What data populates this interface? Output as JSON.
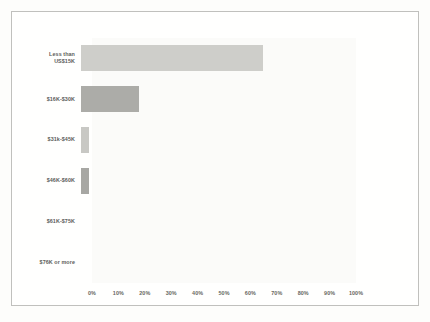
{
  "chart_data": {
    "type": "bar",
    "orientation": "horizontal",
    "title": "",
    "subtitle": "",
    "xlabel": "",
    "ylabel": "",
    "categories": [
      "Less than\nUS$15K",
      "$16K-$30K",
      "$31k-$45K",
      "$46K-$60K",
      "$61K-$75K",
      "$76K or more"
    ],
    "values": [
      69,
      22,
      3,
      3,
      0,
      0
    ],
    "value_suffix": "%",
    "xlim": [
      0,
      100
    ],
    "xticks": [
      0,
      10,
      20,
      30,
      40,
      50,
      60,
      70,
      80,
      90,
      100
    ],
    "xtick_labels": [
      "0%",
      "10%",
      "20%",
      "30%",
      "40%",
      "50%",
      "60%",
      "70%",
      "80%",
      "90%",
      "100%"
    ],
    "grid": false,
    "legend": null,
    "bar_colors": [
      "#c9c9c6",
      "#a3a3a0",
      "#c2c2bf",
      "#9d9d9a",
      "#c9c9c6",
      "#a3a3a0"
    ],
    "annotations": []
  },
  "figure": {
    "border_color": "#b9b9b7",
    "background": "#ffffff",
    "plot_background": "#fbfbfa",
    "tick_color": "#55554f",
    "label_color": "#4a4a48"
  }
}
